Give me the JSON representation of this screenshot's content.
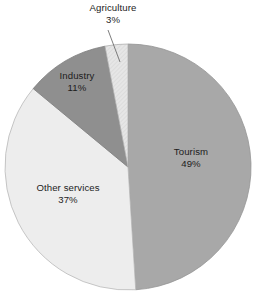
{
  "chart_data": {
    "type": "pie",
    "title": "",
    "subtitle": "",
    "xlabel": "",
    "ylabel": "",
    "legend_position": "none",
    "grid": false,
    "units": "percent",
    "start_angle_deg": 0,
    "direction": "clockwise",
    "categories": [
      "Tourism",
      "Other services",
      "Industry",
      "Agriculture"
    ],
    "values": [
      49,
      37,
      11,
      3
    ],
    "slices": [
      {
        "label": "Tourism",
        "value": 49,
        "value_text": "49%",
        "color": "#a8a8a8",
        "label_placement": "inside",
        "pattern": "solid"
      },
      {
        "label": "Other services",
        "value": 37,
        "value_text": "37%",
        "color": "#ededed",
        "label_placement": "inside",
        "pattern": "solid"
      },
      {
        "label": "Industry",
        "value": 11,
        "value_text": "11%",
        "color": "#8f8f8f",
        "label_placement": "inside",
        "pattern": "solid"
      },
      {
        "label": "Agriculture",
        "value": 3,
        "value_text": "3%",
        "color": "#e3e3e3",
        "label_placement": "outside",
        "pattern": "hatched",
        "has_leader_line": true
      }
    ]
  },
  "colors": {
    "background": "#ffffff",
    "text": "#1c1c1c",
    "outline": "#8a8a8a",
    "leader_line": "#6e6e6e",
    "tourism": "#a8a8a8",
    "other_services": "#ededed",
    "industry": "#8f8f8f",
    "agriculture": "#e3e3e3"
  },
  "labels": {
    "agriculture": {
      "name": "Agriculture",
      "value": "3%"
    },
    "industry": {
      "name": "Industry",
      "value": "11%"
    },
    "tourism": {
      "name": "Tourism",
      "value": "49%"
    },
    "other_services": {
      "name": "Other services",
      "value": "37%"
    }
  }
}
